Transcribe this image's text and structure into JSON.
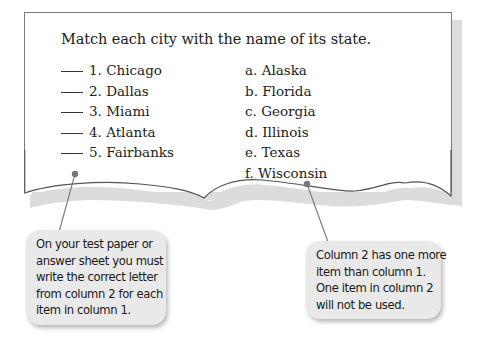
{
  "worksheet": {
    "instruction": "Match each city with the name of its state.",
    "column1": [
      {
        "number": "1.",
        "city": "Chicago"
      },
      {
        "number": "2.",
        "city": "Dallas"
      },
      {
        "number": "3.",
        "city": "Miami"
      },
      {
        "number": "4.",
        "city": "Atlanta"
      },
      {
        "number": "5.",
        "city": "Fairbanks"
      }
    ],
    "column2": [
      {
        "letter": "a.",
        "state": "Alaska"
      },
      {
        "letter": "b.",
        "state": "Florida"
      },
      {
        "letter": "c.",
        "state": "Georgia"
      },
      {
        "letter": "d.",
        "state": "Illinois"
      },
      {
        "letter": "e.",
        "state": "Texas"
      },
      {
        "letter": "f.",
        "state": "Wisconsin"
      }
    ]
  },
  "callouts": {
    "left": {
      "lines": [
        "On your test paper or",
        "answer sheet you must",
        "write the correct letter",
        "from column 2 for each",
        "item in column 1."
      ]
    },
    "right": {
      "lines": [
        "Column 2 has one more",
        "item than column 1.",
        "One item in column 2",
        "will not be used."
      ]
    }
  },
  "colors": {
    "paper_border": "#7a7a7a",
    "paper_shadow": "#dcdcdc",
    "callout_bg": "#e9e9e9",
    "pointer": "#777777"
  }
}
